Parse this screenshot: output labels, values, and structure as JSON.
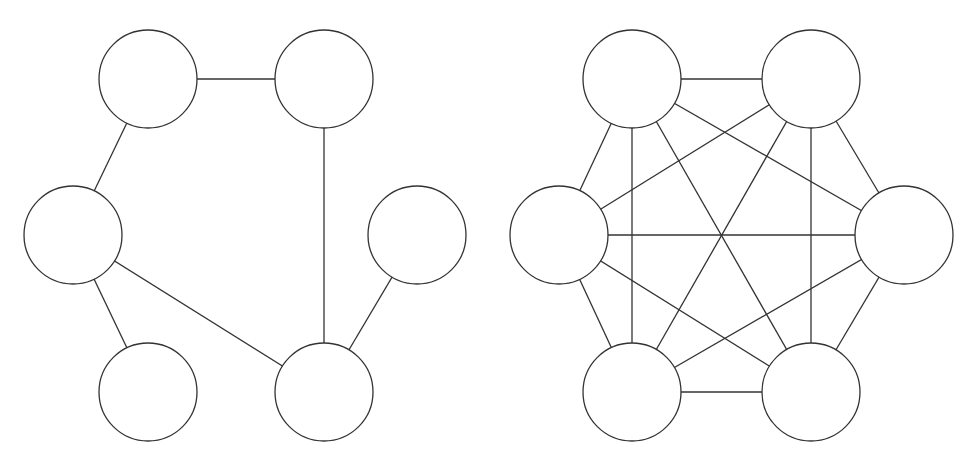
{
  "colors": {
    "stroke": "#333333",
    "background": "#ffffff",
    "node_fill": "#ffffff"
  },
  "node_radius": 49,
  "graphs": [
    {
      "name": "sparse-graph",
      "nodes": [
        {
          "id": "TL",
          "x": 148,
          "y": 79
        },
        {
          "id": "TR",
          "x": 324,
          "y": 79
        },
        {
          "id": "ML",
          "x": 73,
          "y": 235
        },
        {
          "id": "MR",
          "x": 417,
          "y": 235
        },
        {
          "id": "BL",
          "x": 148,
          "y": 392
        },
        {
          "id": "BR",
          "x": 324,
          "y": 392
        }
      ],
      "edges": [
        [
          "TL",
          "TR"
        ],
        [
          "TL",
          "ML"
        ],
        [
          "TR",
          "BR"
        ],
        [
          "ML",
          "BL"
        ],
        [
          "ML",
          "BR"
        ],
        [
          "MR",
          "BR"
        ]
      ]
    },
    {
      "name": "complete-graph-k6",
      "nodes": [
        {
          "id": "TL",
          "x": 632,
          "y": 79
        },
        {
          "id": "TR",
          "x": 811,
          "y": 79
        },
        {
          "id": "ML",
          "x": 559,
          "y": 235
        },
        {
          "id": "MR",
          "x": 904,
          "y": 235
        },
        {
          "id": "BL",
          "x": 632,
          "y": 392
        },
        {
          "id": "BR",
          "x": 811,
          "y": 392
        }
      ],
      "edges": [
        [
          "TL",
          "TR"
        ],
        [
          "TL",
          "ML"
        ],
        [
          "TL",
          "MR"
        ],
        [
          "TL",
          "BL"
        ],
        [
          "TL",
          "BR"
        ],
        [
          "TR",
          "ML"
        ],
        [
          "TR",
          "MR"
        ],
        [
          "TR",
          "BL"
        ],
        [
          "TR",
          "BR"
        ],
        [
          "ML",
          "MR"
        ],
        [
          "ML",
          "BL"
        ],
        [
          "ML",
          "BR"
        ],
        [
          "MR",
          "BL"
        ],
        [
          "MR",
          "BR"
        ],
        [
          "BL",
          "BR"
        ]
      ]
    }
  ]
}
